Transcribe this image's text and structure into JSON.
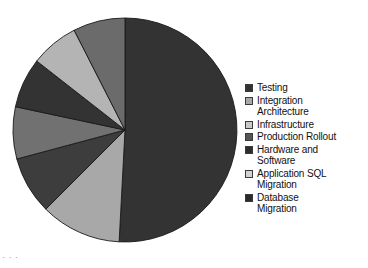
{
  "chart_data": {
    "type": "pie",
    "title": "",
    "subtitle": "",
    "xlabel": "",
    "ylabel": "",
    "legend_position": "right",
    "grid": false,
    "categories": [
      "Testing",
      "Integration Architecture",
      "Infrastructure",
      "Production Rollout",
      "Hardware and Software",
      "Application SQL Migration",
      "Database Migration"
    ],
    "values": [
      50.8,
      11.7,
      8.3,
      7.5,
      7.2,
      6.9,
      7.6
    ],
    "slice_angles_deg": [
      183,
      42,
      30,
      27,
      26,
      25,
      27
    ],
    "colors": [
      "#333333",
      "#a8a8a8",
      "#3d3d3d",
      "#717171",
      "#333333",
      "#b4b4b4",
      "#6b6b6b"
    ],
    "start_angle_deg": 0,
    "direction": "clockwise"
  },
  "legend": {
    "items": [
      {
        "label": "Testing",
        "color": "#333333",
        "swatch_name": "legend-swatch-testing"
      },
      {
        "label": "Integration\nArchitecture",
        "color": "#a8a8a8",
        "swatch_name": "legend-swatch-integration-architecture"
      },
      {
        "label": "Infrastructure",
        "color": "#c8c8c8",
        "swatch_name": "legend-swatch-infrastructure"
      },
      {
        "label": "Production Rollout",
        "color": "#555555",
        "swatch_name": "legend-swatch-production-rollout"
      },
      {
        "label": "Hardware and\nSoftware",
        "color": "#2e2e2e",
        "swatch_name": "legend-swatch-hardware-and-software"
      },
      {
        "label": "Application SQL\nMigration",
        "color": "#d2d2d2",
        "swatch_name": "legend-swatch-application-sql-migration"
      },
      {
        "label": "Database\nMigration",
        "color": "#2b2b2b",
        "swatch_name": "legend-swatch-database-migration"
      }
    ]
  },
  "footer": {
    "note": "· · ·"
  }
}
